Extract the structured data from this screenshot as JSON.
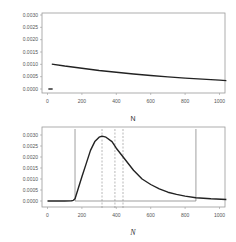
{
  "chart_data": [
    {
      "type": "line",
      "title": "",
      "xlabel": "N",
      "ylabel": "",
      "xlim": [
        -20,
        1040
      ],
      "ylim": [
        0,
        0.003
      ],
      "x_ticks": [
        0,
        200,
        400,
        600,
        800,
        1000
      ],
      "x_tick_labels": [
        "0",
        "200",
        "400",
        "600",
        "800",
        "1000"
      ],
      "y_ticks": [
        0,
        0.0005,
        0.001,
        0.0015,
        0.002,
        0.0025,
        0.003
      ],
      "y_tick_labels": [
        "0.0000",
        "0.0005",
        "0.0010",
        "0.0015",
        "0.0020",
        "0.0025",
        "0.0030"
      ],
      "grid": false,
      "series": [
        {
          "name": "decay",
          "x": [
            25,
            100,
            200,
            300,
            400,
            500,
            600,
            700,
            800,
            900,
            1000,
            1040
          ],
          "values": [
            0.00101,
            0.00093,
            0.00084,
            0.00075,
            0.00068,
            0.00061,
            0.00055,
            0.00049,
            0.00044,
            0.0004,
            0.00036,
            0.00034
          ]
        },
        {
          "name": "baseline-segment",
          "x": [
            5,
            30
          ],
          "values": [
            0,
            0
          ]
        }
      ]
    },
    {
      "type": "line",
      "title": "",
      "xlabel": "N",
      "ylabel": "",
      "xlim": [
        -20,
        1040
      ],
      "ylim": [
        0,
        0.003
      ],
      "x_ticks": [
        0,
        200,
        400,
        600,
        800,
        1000
      ],
      "x_tick_labels": [
        "0",
        "200",
        "400",
        "600",
        "800",
        "1000"
      ],
      "y_ticks": [
        0,
        0.0005,
        0.001,
        0.0015,
        0.002,
        0.0025,
        0.003
      ],
      "y_tick_labels": [
        "0.0000",
        "0.0005",
        "0.0010",
        "0.0015",
        "0.0020",
        "0.0025",
        "0.0030"
      ],
      "grid": false,
      "series": [
        {
          "name": "density",
          "x": [
            0,
            100,
            140,
            150,
            160,
            180,
            200,
            225,
            250,
            275,
            300,
            317,
            340,
            375,
            400,
            450,
            500,
            550,
            600,
            650,
            700,
            750,
            800,
            863,
            950,
            1040
          ],
          "values": [
            0,
            0,
            1e-05,
            3e-05,
            0.0001,
            0.0006,
            0.0011,
            0.0017,
            0.0023,
            0.0027,
            0.0029,
            0.00295,
            0.0029,
            0.0027,
            0.0024,
            0.0019,
            0.0014,
            0.001,
            0.00075,
            0.00055,
            0.0004,
            0.0003,
            0.00022,
            0.00015,
            0.0001,
            7e-05
          ]
        }
      ],
      "reference_lines": {
        "solid_box": {
          "x_left": 160,
          "x_right": 863
        },
        "dashed_x": [
          317,
          392,
          439
        ]
      }
    }
  ]
}
